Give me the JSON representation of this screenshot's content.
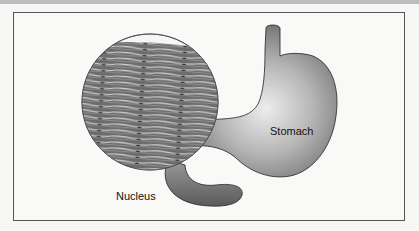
{
  "diagram": {
    "labels": {
      "stomach": "Stomach",
      "nucleus": "Nucleus"
    },
    "colors": {
      "organ_dark": "#6e6e6e",
      "organ_light": "#e6e6e6",
      "outline": "#222222",
      "tissue_base": "#707070",
      "tissue_stripe": "#dcdcdc",
      "frame": "#555555"
    }
  }
}
